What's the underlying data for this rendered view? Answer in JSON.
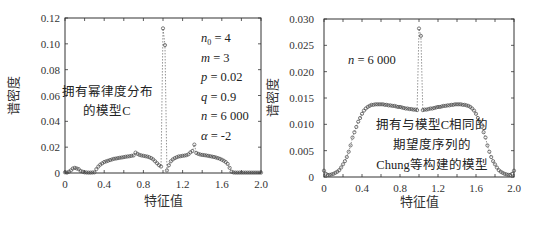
{
  "chart_data": [
    {
      "type": "scatter",
      "title": "",
      "xlabel": "特征值",
      "ylabel": "谱密度",
      "xlim": [
        0,
        2.0
      ],
      "ylim": [
        0,
        0.12
      ],
      "xticks": [
        "0",
        "0.4",
        "0.8",
        "1.2",
        "1.6",
        "2.0"
      ],
      "yticks": [
        "0",
        "0.02",
        "0.04",
        "0.06",
        "0.08",
        "0.10",
        "0.12"
      ],
      "annotation": [
        "拥有幂律度分布",
        "的模型C"
      ],
      "params": [
        "n0 = 4",
        "m = 3",
        "p = 0.02",
        "q = 0.9",
        "n = 6 000",
        "α = -2"
      ],
      "series": [
        {
          "name": "模型C",
          "x": [
            0.0,
            0.02,
            0.04,
            0.06,
            0.08,
            0.1,
            0.12,
            0.14,
            0.16,
            0.18,
            0.2,
            0.22,
            0.24,
            0.26,
            0.28,
            0.3,
            0.32,
            0.34,
            0.36,
            0.38,
            0.4,
            0.42,
            0.44,
            0.46,
            0.48,
            0.5,
            0.52,
            0.54,
            0.56,
            0.58,
            0.6,
            0.62,
            0.64,
            0.66,
            0.68,
            0.7,
            0.72,
            0.74,
            0.76,
            0.78,
            0.8,
            0.82,
            0.84,
            0.86,
            0.88,
            0.9,
            0.92,
            0.94,
            0.96,
            0.98,
            1.0,
            1.02,
            1.04,
            1.06,
            1.08,
            1.1,
            1.12,
            1.14,
            1.16,
            1.18,
            1.2,
            1.22,
            1.24,
            1.26,
            1.28,
            1.3,
            1.32,
            1.34,
            1.36,
            1.38,
            1.4,
            1.42,
            1.44,
            1.46,
            1.48,
            1.5,
            1.52,
            1.54,
            1.56,
            1.58,
            1.6,
            1.62,
            1.64,
            1.66,
            1.68,
            1.7,
            1.72,
            1.74,
            1.76,
            1.78,
            1.8,
            1.82,
            1.84,
            1.86,
            1.88,
            1.9,
            1.92,
            1.94,
            1.96,
            1.98,
            2.0
          ],
          "values": [
            0.0005,
            0.0003,
            0.001,
            0.002,
            0.0035,
            0.004,
            0.0035,
            0.003,
            0.0015,
            0.001,
            0.0005,
            0.0004,
            0.0003,
            0.0003,
            0.0004,
            0.0005,
            0.003,
            0.005,
            0.0065,
            0.0075,
            0.0085,
            0.009,
            0.0095,
            0.01,
            0.0105,
            0.011,
            0.0112,
            0.0115,
            0.0118,
            0.012,
            0.0123,
            0.0126,
            0.0128,
            0.013,
            0.0133,
            0.0136,
            0.0158,
            0.0148,
            0.014,
            0.0136,
            0.0133,
            0.013,
            0.0127,
            0.0122,
            0.0115,
            0.0105,
            0.009,
            0.0075,
            0.006,
            0.005,
            0.112,
            0.099,
            0.002,
            0.006,
            0.009,
            0.0105,
            0.0115,
            0.0122,
            0.0128,
            0.013,
            0.0133,
            0.0135,
            0.0138,
            0.0145,
            0.016,
            0.017,
            0.022,
            0.0155,
            0.0148,
            0.0143,
            0.014,
            0.0138,
            0.0136,
            0.0133,
            0.013,
            0.0127,
            0.0124,
            0.012,
            0.0115,
            0.011,
            0.0103,
            0.0095,
            0.0085,
            0.007,
            0.004,
            0.001,
            0.0004,
            0.0003,
            0.0003,
            0.0003,
            0.0003,
            0.0003,
            0.0003,
            0.0003,
            0.0003,
            0.0003,
            0.0003,
            0.0003,
            0.0003,
            0.0003,
            0.0003
          ]
        }
      ]
    },
    {
      "type": "scatter",
      "title": "",
      "xlabel": "特征值",
      "ylabel": "谱密度",
      "xlim": [
        0,
        2.0
      ],
      "ylim": [
        0,
        0.03
      ],
      "xticks": [
        "0",
        "0.4",
        "0.8",
        "1.2",
        "1.6",
        "2.0"
      ],
      "yticks": [
        "0",
        "0.005",
        "0.010",
        "0.015",
        "0.020",
        "0.025",
        "0.030"
      ],
      "annotation": [
        "拥有与模型C相同的",
        "期望度序列的",
        "Chung等构建的模型"
      ],
      "params": [
        "n = 6 000"
      ],
      "series": [
        {
          "name": "Chung等构建的模型",
          "x": [
            0.0,
            0.02,
            0.04,
            0.06,
            0.08,
            0.1,
            0.12,
            0.14,
            0.16,
            0.18,
            0.2,
            0.22,
            0.24,
            0.26,
            0.28,
            0.3,
            0.32,
            0.34,
            0.36,
            0.38,
            0.4,
            0.42,
            0.44,
            0.46,
            0.48,
            0.5,
            0.52,
            0.54,
            0.56,
            0.58,
            0.6,
            0.62,
            0.64,
            0.66,
            0.68,
            0.7,
            0.72,
            0.74,
            0.76,
            0.78,
            0.8,
            0.82,
            0.84,
            0.86,
            0.88,
            0.9,
            0.92,
            0.94,
            0.96,
            0.98,
            1.0,
            1.02,
            1.04,
            1.06,
            1.08,
            1.1,
            1.12,
            1.14,
            1.16,
            1.18,
            1.2,
            1.22,
            1.24,
            1.26,
            1.28,
            1.3,
            1.32,
            1.34,
            1.36,
            1.38,
            1.4,
            1.42,
            1.44,
            1.46,
            1.48,
            1.5,
            1.52,
            1.54,
            1.56,
            1.58,
            1.6,
            1.62,
            1.64,
            1.66,
            1.68,
            1.7,
            1.72,
            1.74,
            1.76,
            1.78,
            1.8,
            1.82,
            1.84,
            1.86,
            1.88,
            1.9,
            1.92,
            1.94,
            1.96,
            1.98,
            2.0
          ],
          "values": [
            0.0012,
            0.0006,
            0.0004,
            0.0004,
            0.0005,
            0.0006,
            0.0008,
            0.001,
            0.0013,
            0.0018,
            0.0024,
            0.003,
            0.0038,
            0.0048,
            0.006,
            0.0075,
            0.0085,
            0.0095,
            0.0105,
            0.0112,
            0.012,
            0.0126,
            0.013,
            0.0133,
            0.0135,
            0.0137,
            0.0137,
            0.0138,
            0.0138,
            0.0138,
            0.0138,
            0.0138,
            0.0137,
            0.0137,
            0.0136,
            0.0136,
            0.0135,
            0.0135,
            0.0134,
            0.0133,
            0.0133,
            0.0132,
            0.0131,
            0.013,
            0.013,
            0.0129,
            0.0129,
            0.0128,
            0.0128,
            0.0127,
            0.0282,
            0.0268,
            0.0127,
            0.0128,
            0.0128,
            0.0129,
            0.013,
            0.013,
            0.0131,
            0.0132,
            0.0133,
            0.0133,
            0.0134,
            0.0135,
            0.0135,
            0.0136,
            0.0136,
            0.0137,
            0.0137,
            0.0138,
            0.0138,
            0.0138,
            0.0138,
            0.0137,
            0.0137,
            0.0136,
            0.0135,
            0.0133,
            0.013,
            0.0126,
            0.012,
            0.0112,
            0.0105,
            0.0095,
            0.0085,
            0.0075,
            0.006,
            0.0048,
            0.0038,
            0.003,
            0.0024,
            0.0018,
            0.0013,
            0.001,
            0.0008,
            0.0006,
            0.0005,
            0.0004,
            0.0004,
            0.0006,
            0.0012
          ]
        }
      ]
    }
  ]
}
